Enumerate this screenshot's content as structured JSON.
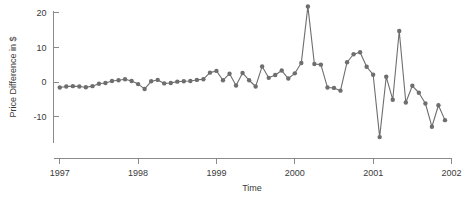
{
  "chart_data": {
    "type": "line",
    "title": "",
    "subtitle": "",
    "xlabel": "Time",
    "ylabel": "Price Difference in $",
    "xlim": [
      1996.92,
      2002.0
    ],
    "ylim": [
      -18.5,
      23.5
    ],
    "grid": false,
    "legend": null,
    "marker": "circle",
    "marker_color": "#6e6e6e",
    "line_color": "#6e6e6e",
    "xticks": [
      1997,
      1998,
      1999,
      2000,
      2001,
      2002
    ],
    "xtick_labels": [
      "1997",
      "1998",
      "1999",
      "2000",
      "2001",
      "2002"
    ],
    "yticks": [
      20,
      10,
      0,
      -10
    ],
    "ytick_labels": [
      "20",
      "10",
      "0",
      "-10"
    ],
    "series": [
      {
        "name": "Price Difference",
        "x": [
          1997.0,
          1997.083,
          1997.167,
          1997.25,
          1997.333,
          1997.417,
          1997.5,
          1997.583,
          1997.667,
          1997.75,
          1997.833,
          1997.917,
          1998.0,
          1998.083,
          1998.167,
          1998.25,
          1998.333,
          1998.417,
          1998.5,
          1998.583,
          1998.667,
          1998.75,
          1998.833,
          1998.917,
          1999.0,
          1999.083,
          1999.167,
          1999.25,
          1999.333,
          1999.417,
          1999.5,
          1999.583,
          1999.667,
          1999.75,
          1999.833,
          1999.917,
          2000.0,
          2000.083,
          2000.167,
          2000.25,
          2000.333,
          2000.417,
          2000.5,
          2000.583,
          2000.667,
          2000.75,
          2000.833,
          2000.917,
          2001.0,
          2001.083,
          2001.167,
          2001.25,
          2001.333,
          2001.417,
          2001.5,
          2001.583,
          2001.667,
          2001.75,
          2001.833,
          2001.917
        ],
        "values": [
          -1.6,
          -1.3,
          -1.2,
          -1.3,
          -1.5,
          -1.2,
          -0.5,
          -0.3,
          0.3,
          0.5,
          0.8,
          0.3,
          -0.6,
          -2.0,
          0.2,
          0.6,
          -0.4,
          -0.3,
          0.1,
          0.2,
          0.3,
          0.6,
          0.8,
          2.7,
          3.2,
          0.5,
          2.4,
          -1.0,
          2.6,
          0.5,
          -1.3,
          4.5,
          1.2,
          2.0,
          3.3,
          1.0,
          2.5,
          5.5,
          21.8,
          5.2,
          5.0,
          -1.6,
          -1.7,
          -2.5,
          5.7,
          8.0,
          8.6,
          4.4,
          2.1,
          -15.9,
          1.5,
          -5.1,
          14.7,
          -5.9,
          -1.1,
          -3.1,
          -6.2,
          -12.9,
          -6.7,
          -11.0
        ]
      }
    ]
  },
  "axes": {
    "y_label": "Price Difference in $",
    "x_label": "Time"
  }
}
